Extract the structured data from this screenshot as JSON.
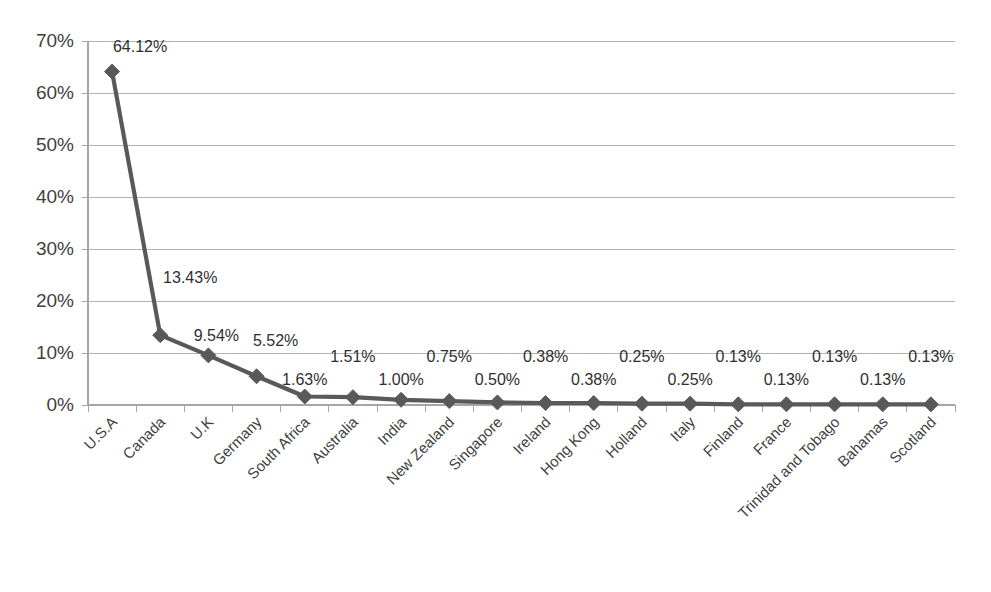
{
  "chart_data": {
    "type": "line",
    "title": "",
    "subtitle": "",
    "xlabel": "",
    "ylabel": "",
    "ylim": [
      0,
      70
    ],
    "ytick_labels": [
      "0%",
      "10%",
      "20%",
      "30%",
      "40%",
      "50%",
      "60%",
      "70%"
    ],
    "ytick_values": [
      0,
      10,
      20,
      30,
      40,
      50,
      60,
      70
    ],
    "grid": true,
    "legend": "none",
    "series_color": "#595959",
    "gridline_color": "#b3b3b3",
    "axis_color": "#a6a6a6",
    "marker": "diamond",
    "categories": [
      "U.S.A",
      "Canada",
      "U.K",
      "Germany",
      "South Africa",
      "Australia",
      "India",
      "New Zealand",
      "Singapore",
      "Ireland",
      "Hong Kong",
      "Holland",
      "Italy",
      "Finland",
      "France",
      "Trinidad and Tobago",
      "Bahamas",
      "Scotland"
    ],
    "values": [
      64.12,
      13.43,
      9.54,
      5.52,
      1.63,
      1.51,
      1.0,
      0.75,
      0.5,
      0.38,
      0.38,
      0.25,
      0.25,
      0.13,
      0.13,
      0.13,
      0.13,
      0.13
    ],
    "data_labels": [
      "64.12%",
      "13.43%",
      "9.54%",
      "5.52%",
      "1.63%",
      "1.51%",
      "1.00%",
      "0.75%",
      "0.50%",
      "0.38%",
      "0.38%",
      "0.25%",
      "0.25%",
      "0.13%",
      "0.13%",
      "0.13%",
      "0.13%",
      "0.13%"
    ],
    "label_placement": [
      "above",
      "below",
      "below",
      "above",
      "below",
      "above",
      "below",
      "above",
      "below",
      "above",
      "below",
      "above",
      "below",
      "above",
      "below",
      "above",
      "below",
      "above"
    ]
  }
}
